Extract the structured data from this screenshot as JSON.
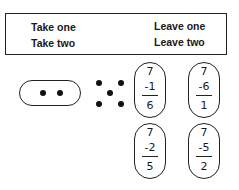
{
  "box": {
    "left_items": [
      "Take one",
      "Take two"
    ],
    "right_items": [
      "Leave one",
      "Leave two"
    ]
  },
  "oval": {
    "dots": 2
  },
  "dot_pattern": {
    "dots": 5
  },
  "subtractions": [
    {
      "minuend": "7",
      "subtrahend": "-1",
      "result": "6"
    },
    {
      "minuend": "7",
      "subtrahend": "-6",
      "result": "1"
    },
    {
      "minuend": "7",
      "subtrahend": "-2",
      "result": "5"
    },
    {
      "minuend": "7",
      "subtrahend": "-5",
      "result": "2"
    }
  ]
}
